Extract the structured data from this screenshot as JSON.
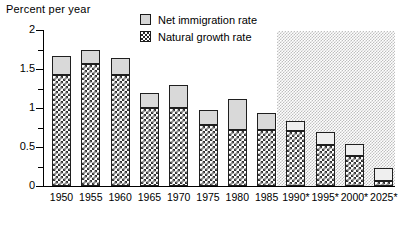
{
  "axis_title": "Percent per year",
  "legend": {
    "items": [
      {
        "label": "Net immigration rate",
        "swatch": "light-gray-square"
      },
      {
        "label": "Natural growth rate",
        "swatch": "checkered-square"
      }
    ]
  },
  "y_ticks": [
    "0",
    "0.5",
    "1",
    "1.5",
    "2"
  ],
  "chart_data": {
    "type": "bar",
    "subtype": "stacked-bar",
    "title": "",
    "xlabel": "",
    "ylabel": "Percent per year",
    "ylim": [
      0,
      2
    ],
    "ytick_values": [
      0,
      0.5,
      1,
      1.5,
      2
    ],
    "ytick_labels": [
      "0",
      "0.5",
      "1",
      "1.5",
      "2"
    ],
    "minor_tick_interval": 0.25,
    "grid": false,
    "legend_position": "top-center",
    "categories": [
      "1950",
      "1955",
      "1960",
      "1965",
      "1970",
      "1975",
      "1980",
      "1985",
      "1990*",
      "1995*",
      "2000*",
      "2025*"
    ],
    "projected_categories": [
      "1990*",
      "1995*",
      "2000*",
      "2025*"
    ],
    "projection_note": "* denotes projected values (shaded region)",
    "series": [
      {
        "name": "Natural growth rate",
        "values": [
          1.42,
          1.56,
          1.42,
          1.0,
          1.0,
          0.78,
          0.72,
          0.72,
          0.7,
          0.52,
          0.38,
          0.07
        ]
      },
      {
        "name": "Net immigration rate",
        "values": [
          0.25,
          0.18,
          0.22,
          0.19,
          0.29,
          0.19,
          0.4,
          0.21,
          0.14,
          0.17,
          0.16,
          0.16
        ]
      }
    ],
    "totals": [
      1.67,
      1.74,
      1.64,
      1.19,
      1.29,
      0.97,
      1.12,
      0.93,
      0.84,
      0.69,
      0.54,
      0.23
    ]
  }
}
